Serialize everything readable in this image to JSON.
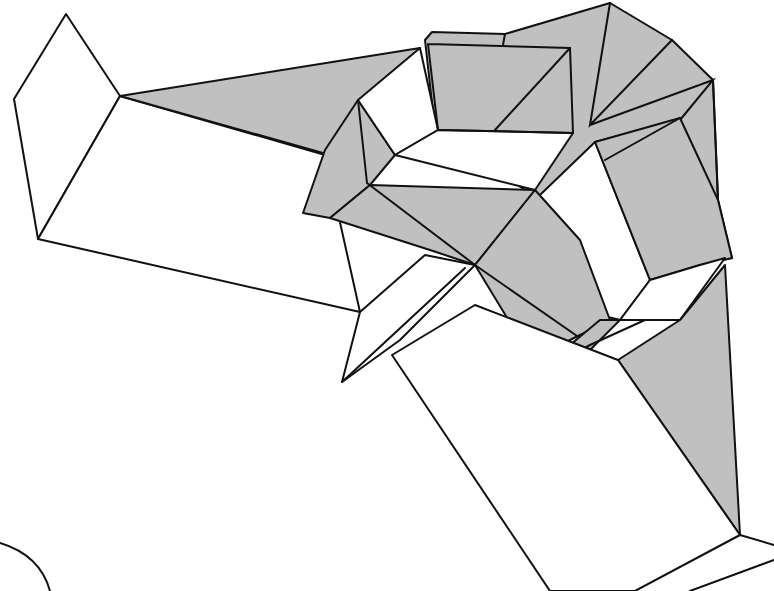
{
  "diagram": {
    "type": "origami-fold-illustration",
    "colors": {
      "shade": "#c0c0c0",
      "line": "#111111",
      "background": "#ffffff"
    }
  }
}
